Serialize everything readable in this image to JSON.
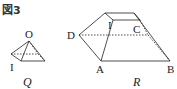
{
  "figure": {
    "title": "図3",
    "solids": [
      {
        "name": "Q",
        "caption": "Q",
        "shape": "square pyramid",
        "vertex_labels": {
          "apex": "O",
          "base_vertex": "I"
        }
      },
      {
        "name": "R",
        "caption": "R",
        "shape": "truncated pyramid (frustum)",
        "vertex_labels": {
          "top_left": "I",
          "top_right": "C",
          "left": "D",
          "front_left": "A",
          "front_right": "B"
        }
      }
    ]
  },
  "colors": {
    "line": "#222222",
    "background": "#ffffff"
  }
}
